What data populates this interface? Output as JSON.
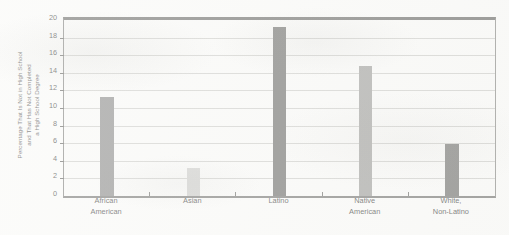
{
  "chart_data": {
    "type": "bar",
    "title": "",
    "xlabel": "",
    "ylabel": "Percentage That Is Not in High School and That Has Not Completed a High School Degree",
    "ylabel_lines": [
      "Percentage That Is Not in High School",
      "and That Has Not Completed",
      "a High School Degree"
    ],
    "categories": [
      "African American",
      "Asian",
      "Latino",
      "Native American",
      "White, Non-Latino"
    ],
    "category_lines": [
      [
        "African",
        "American"
      ],
      [
        "Asian"
      ],
      [
        "Latino"
      ],
      [
        "Native",
        "American"
      ],
      [
        "White,",
        "Non-Latino"
      ]
    ],
    "values": [
      11.3,
      3.2,
      19.2,
      14.8,
      5.9
    ],
    "bar_colors": [
      "#7b7b7b",
      "#c9c9c7",
      "#5a5a58",
      "#949492",
      "#60605e"
    ],
    "ylim": [
      0,
      20
    ],
    "yticks": [
      0,
      2,
      4,
      6,
      8,
      10,
      12,
      14,
      16,
      18,
      20
    ],
    "ytick_labels": [
      "0",
      "2",
      "4",
      "6",
      "8",
      "10",
      "12",
      "14",
      "16",
      "18",
      "20"
    ],
    "grid": true,
    "grid_axis": "y",
    "legend": false,
    "legend_position": "none",
    "annotations": []
  }
}
